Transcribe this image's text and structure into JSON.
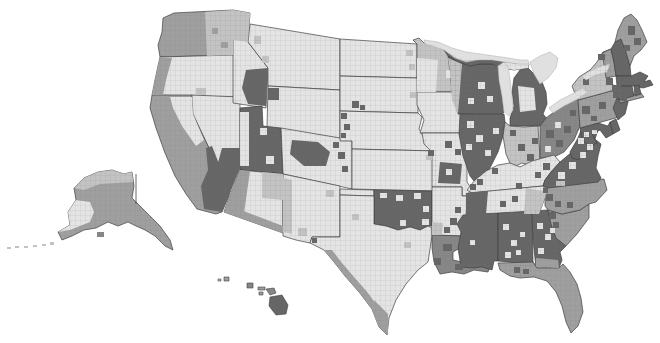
{
  "map": {
    "description": "United States county-level grayscale choropleth map with Alaska and Hawaii insets",
    "colors": {
      "ocean": "#ffffff",
      "water": "#e0e0e0",
      "water_stroke": "#b5b5b5",
      "border": "#3f3f3f",
      "county_line": "#6f6f6f",
      "bins": {
        "b1": "#e4e4e4",
        "b2": "#c3c3c3",
        "b3": "#9f9f9f",
        "b4": "#878787",
        "b5": "#666666"
      }
    },
    "states": {
      "WA": {
        "name": "Washington",
        "fill_bin": "b3"
      },
      "OR": {
        "name": "Oregon",
        "fill_bin": "b1"
      },
      "CA": {
        "name": "California",
        "fill_bin": "b3"
      },
      "NV": {
        "name": "Nevada",
        "fill_bin": "b1"
      },
      "ID": {
        "name": "Idaho",
        "fill_bin": "b1"
      },
      "MT": {
        "name": "Montana",
        "fill_bin": "b1"
      },
      "WY": {
        "name": "Wyoming",
        "fill_bin": "b1"
      },
      "UT": {
        "name": "Utah",
        "fill_bin": "b5"
      },
      "CO": {
        "name": "Colorado",
        "fill_bin": "b1"
      },
      "AZ": {
        "name": "Arizona",
        "fill_bin": "b1"
      },
      "NM": {
        "name": "New Mexico",
        "fill_bin": "b1"
      },
      "ND": {
        "name": "North Dakota",
        "fill_bin": "b1"
      },
      "SD": {
        "name": "South Dakota",
        "fill_bin": "b1"
      },
      "NE": {
        "name": "Nebraska",
        "fill_bin": "b1"
      },
      "KS": {
        "name": "Kansas",
        "fill_bin": "b1"
      },
      "OK": {
        "name": "Oklahoma",
        "fill_bin": "b5"
      },
      "OK_PAN": {
        "name": "Oklahoma panhandle",
        "fill_bin": "b1"
      },
      "TX": {
        "name": "Texas",
        "fill_bin": "b1"
      },
      "MN": {
        "name": "Minnesota",
        "fill_bin": "b2"
      },
      "IA": {
        "name": "Iowa",
        "fill_bin": "b1"
      },
      "MO": {
        "name": "Missouri",
        "fill_bin": "b1"
      },
      "AR": {
        "name": "Arkansas",
        "fill_bin": "b1"
      },
      "LA": {
        "name": "Louisiana",
        "fill_bin": "b4"
      },
      "WI": {
        "name": "Wisconsin",
        "fill_bin": "b5"
      },
      "MI_UP": {
        "name": "Michigan Upper Peninsula",
        "fill_bin": "b5"
      },
      "MI": {
        "name": "Michigan",
        "fill_bin": "b5"
      },
      "IL": {
        "name": "Illinois",
        "fill_bin": "b5"
      },
      "IN": {
        "name": "Indiana",
        "fill_bin": "b2"
      },
      "OH": {
        "name": "Ohio",
        "fill_bin": "b4"
      },
      "KY": {
        "name": "Kentucky",
        "fill_bin": "b1"
      },
      "TN": {
        "name": "Tennessee",
        "fill_bin": "b1"
      },
      "MS": {
        "name": "Mississippi",
        "fill_bin": "b5"
      },
      "AL": {
        "name": "Alabama",
        "fill_bin": "b5"
      },
      "GA": {
        "name": "Georgia",
        "fill_bin": "b5"
      },
      "FL": {
        "name": "Florida",
        "fill_bin": "b3"
      },
      "SC": {
        "name": "South Carolina",
        "fill_bin": "b3"
      },
      "NC": {
        "name": "North Carolina",
        "fill_bin": "b3"
      },
      "VA": {
        "name": "Virginia",
        "fill_bin": "b5"
      },
      "WV": {
        "name": "West Virginia",
        "fill_bin": "b5"
      },
      "MD": {
        "name": "Maryland",
        "fill_bin": "b5"
      },
      "DE": {
        "name": "Delaware",
        "fill_bin": "b5"
      },
      "PA": {
        "name": "Pennsylvania",
        "fill_bin": "b3"
      },
      "NJ": {
        "name": "New Jersey",
        "fill_bin": "b5"
      },
      "NY": {
        "name": "New York",
        "fill_bin": "b2"
      },
      "LI": {
        "name": "Long Island",
        "fill_bin": "b3"
      },
      "VT": {
        "name": "Vermont",
        "fill_bin": "b3"
      },
      "NH": {
        "name": "New Hampshire",
        "fill_bin": "b5"
      },
      "ME": {
        "name": "Maine",
        "fill_bin": "b3"
      },
      "MA": {
        "name": "Massachusetts",
        "fill_bin": "b5"
      },
      "CT": {
        "name": "Connecticut",
        "fill_bin": "b5"
      },
      "RI": {
        "name": "Rhode Island",
        "fill_bin": "b5"
      },
      "AK": {
        "name": "Alaska",
        "fill_bin": "b3"
      },
      "HI_KAUAI": {
        "name": "Kauai",
        "fill_bin": "b3"
      },
      "HI_NIIHAU": {
        "name": "Niihau",
        "fill_bin": "b2"
      },
      "HI_OAHU": {
        "name": "Oahu",
        "fill_bin": "b4"
      },
      "HI_MOLOKAI": {
        "name": "Molokai",
        "fill_bin": "b3"
      },
      "HI_LANAI": {
        "name": "Lanai",
        "fill_bin": "b3"
      },
      "HI_MAUI": {
        "name": "Maui",
        "fill_bin": "b4"
      },
      "HI_BIG": {
        "name": "Hawaii Island",
        "fill_bin": "b5"
      }
    },
    "lakes": [
      "Lake Superior",
      "Lake Michigan",
      "Lake Huron",
      "Lake Erie",
      "Lake Ontario"
    ]
  }
}
